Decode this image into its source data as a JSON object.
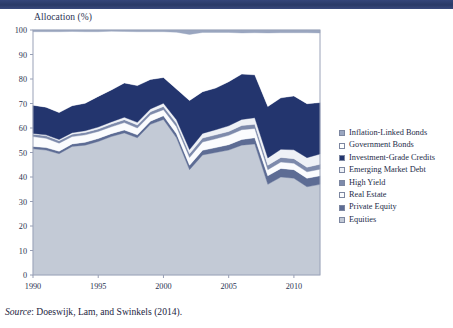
{
  "header": {
    "bar_color": "#2b3c6b"
  },
  "axis_title": "Allocation (%)",
  "source": {
    "label": "Source",
    "text": ": Doeswijk, Lam, and Swinkels (2014)."
  },
  "legend": {
    "items": [
      {
        "label": "Inflation-Linked Bonds",
        "color": "#9aa6c0"
      },
      {
        "label": "Government Bonds",
        "color": "#ffffff"
      },
      {
        "label": "Investment-Grade Credits",
        "color": "#23356e"
      },
      {
        "label": "Emerging Market Debt",
        "color": "#eef1f6"
      },
      {
        "label": "High Yield",
        "color": "#7d8aab"
      },
      {
        "label": "Real Estate",
        "color": "#fbfcfe"
      },
      {
        "label": "Private Equity",
        "color": "#5d6c94"
      },
      {
        "label": "Equities",
        "color": "#c3cad6"
      }
    ]
  },
  "chart_data": {
    "type": "area",
    "title": "",
    "xlabel": "",
    "ylabel": "Allocation (%)",
    "xlim": [
      1990,
      2012
    ],
    "ylim": [
      0,
      100
    ],
    "yticks": [
      0,
      10,
      20,
      30,
      40,
      50,
      60,
      70,
      80,
      90,
      100
    ],
    "xticks": [
      1990,
      1995,
      2000,
      2005,
      2010
    ],
    "grid": false,
    "legend_position": "right",
    "stacked": true,
    "stack_order_bottom_to_top": [
      "Equities",
      "Private Equity",
      "Real Estate",
      "High Yield",
      "Emerging Market Debt",
      "Investment-Grade Credits",
      "Government Bonds",
      "Inflation-Linked Bonds"
    ],
    "x": [
      1990,
      1991,
      1992,
      1993,
      1994,
      1995,
      1996,
      1997,
      1998,
      1999,
      2000,
      2001,
      2002,
      2003,
      2004,
      2005,
      2006,
      2007,
      2008,
      2009,
      2010,
      2011,
      2012
    ],
    "series": [
      {
        "name": "Equities",
        "color": "#c3cad6",
        "values": [
          51.5,
          51.0,
          49.5,
          52.5,
          53.0,
          54.5,
          56.5,
          58.0,
          56.0,
          61.5,
          63.5,
          56.0,
          43.0,
          49.0,
          50.0,
          51.0,
          53.0,
          53.5,
          37.0,
          40.0,
          39.5,
          36.0,
          37.0
        ]
      },
      {
        "name": "Private Equity",
        "color": "#5d6c94",
        "values": [
          1.0,
          1.0,
          1.0,
          1.0,
          1.2,
          1.2,
          1.2,
          1.2,
          1.2,
          1.3,
          1.5,
          1.7,
          1.8,
          1.9,
          2.0,
          2.2,
          2.3,
          2.5,
          3.5,
          3.5,
          3.5,
          3.5,
          3.5
        ]
      },
      {
        "name": "Real Estate",
        "color": "#fbfcfe",
        "values": [
          4.0,
          3.8,
          3.3,
          3.0,
          3.0,
          2.9,
          2.8,
          3.0,
          2.8,
          2.6,
          2.5,
          2.8,
          3.2,
          3.4,
          3.6,
          3.8,
          4.0,
          3.8,
          2.5,
          2.6,
          2.6,
          2.6,
          2.7
        ]
      },
      {
        "name": "High Yield",
        "color": "#7d8aab",
        "values": [
          1.0,
          1.0,
          1.0,
          1.0,
          1.0,
          1.0,
          1.1,
          1.2,
          1.2,
          1.2,
          1.3,
          1.4,
          1.5,
          1.6,
          1.6,
          1.6,
          1.7,
          1.7,
          1.8,
          1.9,
          1.9,
          1.9,
          2.0
        ]
      },
      {
        "name": "Emerging Market Debt",
        "color": "#eef1f6",
        "values": [
          0.3,
          0.4,
          0.5,
          0.6,
          0.7,
          0.8,
          0.9,
          1.0,
          1.1,
          1.2,
          1.3,
          1.5,
          1.7,
          1.9,
          2.1,
          2.3,
          2.5,
          2.7,
          3.0,
          3.3,
          3.6,
          3.9,
          4.2
        ]
      },
      {
        "name": "Investment-Grade Credits",
        "color": "#23356e",
        "values": [
          11.5,
          11.3,
          11.0,
          11.0,
          11.2,
          12.5,
          13.0,
          14.0,
          15.0,
          12.0,
          10.5,
          12.5,
          20.0,
          17.0,
          17.0,
          18.0,
          18.5,
          17.5,
          21.0,
          21.0,
          22.0,
          22.0,
          21.0
        ]
      },
      {
        "name": "Government Bonds",
        "color": "#ffffff",
        "values": [
          30.0,
          30.8,
          33.0,
          30.3,
          29.2,
          26.4,
          24.0,
          21.0,
          22.0,
          19.5,
          18.7,
          23.2,
          27.0,
          24.2,
          22.7,
          20.1,
          16.8,
          17.2,
          30.0,
          26.6,
          25.8,
          29.0,
          28.4
        ]
      },
      {
        "name": "Inflation-Linked Bonds",
        "color": "#9aa6c0",
        "values": [
          0.7,
          0.7,
          0.7,
          0.6,
          0.7,
          0.7,
          0.5,
          0.6,
          0.7,
          0.7,
          0.7,
          0.9,
          1.8,
          1.0,
          1.0,
          1.0,
          1.2,
          1.1,
          1.2,
          1.1,
          1.1,
          1.1,
          1.2
        ]
      }
    ]
  }
}
